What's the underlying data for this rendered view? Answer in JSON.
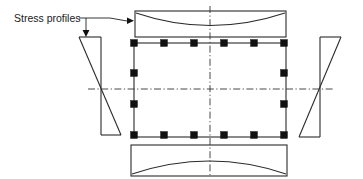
{
  "figure": {
    "kind": "engineering-cross-section-diagram",
    "background_color": "#ffffff",
    "line_color": "#2b2b2b",
    "rebar_color": "#111111",
    "centerline_color": "#333333",
    "width": 363,
    "height": 179
  },
  "annotations": {
    "stress_profiles_label": "Stress profiles",
    "label_x": 14,
    "label_y": 22,
    "leader_polyline": "M 79 18 L 110 18 L 127 21",
    "leader_branch": "M 86 18 L 86 31",
    "arrow_right_points": "127,17.5 134,20.8 127,24.1",
    "arrow_down_points": "82.6,30 89.4,30 86,37"
  },
  "section": {
    "name": "reinforced-concrete-column-section",
    "rect": {
      "x": 134,
      "y": 43,
      "width": 152,
      "height": 94
    },
    "rebar_size": 7,
    "rebar_count_total": 16,
    "rebar_top_count": 6,
    "rebar_bottom_count": 6,
    "rebar_left_count": 4,
    "rebar_right_count": 4,
    "rebars": [
      {
        "x": 134,
        "y": 43
      },
      {
        "x": 164,
        "y": 43
      },
      {
        "x": 194,
        "y": 43
      },
      {
        "x": 224,
        "y": 43
      },
      {
        "x": 254,
        "y": 43
      },
      {
        "x": 284,
        "y": 43
      },
      {
        "x": 134,
        "y": 73
      },
      {
        "x": 284,
        "y": 73
      },
      {
        "x": 134,
        "y": 104
      },
      {
        "x": 284,
        "y": 104
      },
      {
        "x": 134,
        "y": 135
      },
      {
        "x": 164,
        "y": 135
      },
      {
        "x": 194,
        "y": 135
      },
      {
        "x": 224,
        "y": 135
      },
      {
        "x": 254,
        "y": 135
      },
      {
        "x": 284,
        "y": 135
      }
    ]
  },
  "centerlines": {
    "vertical": {
      "x": 210,
      "y1": 6,
      "y2": 176
    },
    "horizontal": {
      "y": 89,
      "x1": 88,
      "x2": 334
    }
  },
  "profiles": {
    "top": {
      "name": "top-stress-profile",
      "rect": {
        "x": 135,
        "y": 11,
        "width": 151,
        "height": 26
      },
      "curve_type": "concave",
      "curve_path": "M 136 13 Q 210 38 285 13"
    },
    "bottom": {
      "name": "bottom-stress-profile",
      "rect": {
        "x": 131,
        "y": 145,
        "width": 156,
        "height": 31
      },
      "curve_type": "convex",
      "curve_path": "M 132 174 Q 210 148 286 174"
    },
    "left": {
      "name": "left-stress-profile",
      "curve_type": "linear-bending-bowtie",
      "vertical_path": "M 101 37 L 101 135",
      "top_path": "M 79 37 L 101 37",
      "bottom_path": "M 101 135 L 121 135",
      "diagonal_path": "M 79 37 L 121 135"
    },
    "right": {
      "name": "right-stress-profile",
      "curve_type": "linear-bending-bowtie",
      "vertical_path": "M 320 37 L 320 137",
      "top_path": "M 320 37 L 341 37",
      "bottom_path": "M 299 137 L 320 137",
      "diagonal_path": "M 299 137 L 341 37"
    }
  }
}
